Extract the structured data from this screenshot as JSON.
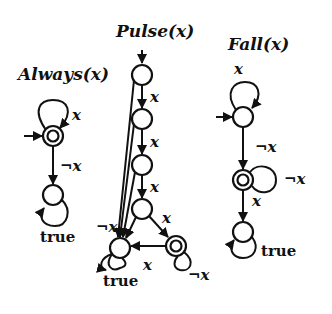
{
  "diagrams": [
    {
      "id": "always",
      "title": "Always(x)",
      "labels": {
        "self_loop_start": "x",
        "to_sink": "¬x",
        "sink_loop": "true"
      }
    },
    {
      "id": "pulse",
      "title": "Pulse(x)",
      "labels": {
        "e1": "x",
        "e2": "x",
        "e3": "x",
        "e4": "x",
        "neg": "¬x",
        "acc_to_sink": "x",
        "sink_loop": "true",
        "acc_loop": "¬x"
      }
    },
    {
      "id": "fall",
      "title": "Fall(x)",
      "labels": {
        "start_loop": "x",
        "to_acc": "¬x",
        "acc_loop": "¬x",
        "to_sink": "x",
        "sink_loop": "true"
      }
    }
  ],
  "colors": {
    "ink": "#111111",
    "background": "#ffffff"
  }
}
